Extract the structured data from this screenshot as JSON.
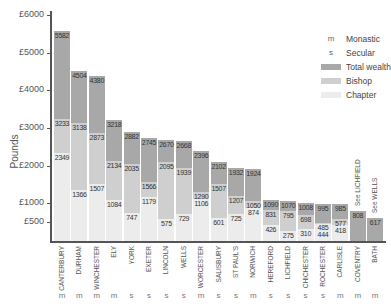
{
  "chart_data": {
    "type": "bar",
    "stacked_overlay": true,
    "title": "",
    "xlabel": "",
    "ylabel": "Pounds",
    "ylim": [
      0,
      6000
    ],
    "yticks": [
      {
        "value": 500,
        "label": "£500"
      },
      {
        "value": 1000,
        "label": "£1000"
      },
      {
        "value": 2000,
        "label": "£2000"
      },
      {
        "value": 3000,
        "label": "£3000"
      },
      {
        "value": 4000,
        "label": "£4000"
      },
      {
        "value": 5000,
        "label": "£5000"
      },
      {
        "value": 6000,
        "label": "£6000"
      }
    ],
    "categories": [
      "CANTERBURY",
      "DURHAM",
      "WINCHESTER",
      "ELY",
      "YORK",
      "EXETER",
      "LINCOLN",
      "WELLS",
      "WORCESTER",
      "SALISBURY",
      "ST PAUL'S",
      "NORWICH",
      "HEREFORD",
      "LICHFIELD",
      "CHICHESTER",
      "ROCHESTER",
      "CARLISLE",
      "COVENTRY",
      "BATH"
    ],
    "category_types": [
      "m",
      "m",
      "m",
      "m",
      "s",
      "s",
      "s",
      "s",
      "m",
      "s",
      "s",
      "m",
      "s",
      "s",
      "s",
      "s",
      "m",
      "m",
      "m"
    ],
    "series": [
      {
        "name": "Total wealth",
        "color": "#a8a8a8",
        "values": [
          5582,
          4504,
          4380,
          3218,
          2882,
          2745,
          2670,
          2668,
          2396,
          2102,
          1932,
          1924,
          1090,
          1070,
          1008,
          995,
          985,
          808,
          617
        ]
      },
      {
        "name": "Bishop",
        "color": "#cfcfcf",
        "values": [
          3233,
          3138,
          2873,
          2134,
          2035,
          1566,
          2095,
          1939,
          1290,
          1507,
          1207,
          1050,
          831,
          795,
          698,
          485,
          577,
          null,
          null
        ]
      },
      {
        "name": "Chapter",
        "color": "#ececec",
        "values": [
          2349,
          1366,
          1507,
          1084,
          747,
          1179,
          575,
          729,
          1106,
          601,
          725,
          874,
          426,
          275,
          310,
          444,
          418,
          null,
          null
        ]
      }
    ],
    "annotations": [
      {
        "category": "COVENTRY",
        "text": "See LICHFIELD"
      },
      {
        "category": "BATH",
        "text": "See WELLS"
      }
    ],
    "legend": {
      "position": "upper right",
      "entries": [
        {
          "symbol": "m",
          "label": "Monastic"
        },
        {
          "symbol": "s",
          "label": "Secular"
        },
        {
          "swatch": "#a8a8a8",
          "label": "Total wealth"
        },
        {
          "swatch": "#cfcfcf",
          "label": "Bishop"
        },
        {
          "swatch": "#ececec",
          "label": "Chapter"
        }
      ]
    },
    "grid": false
  }
}
